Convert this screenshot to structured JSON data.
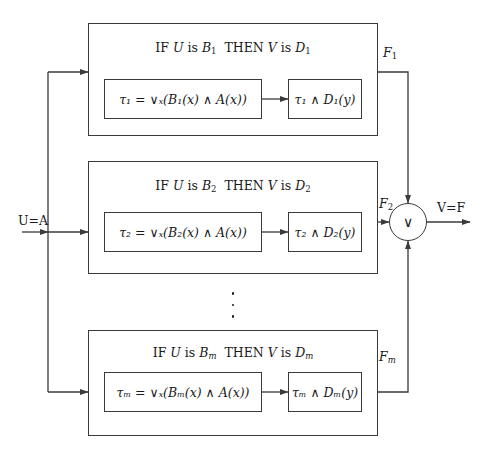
{
  "diagram": {
    "input_label": "U=A",
    "output_label": "V=F",
    "aggregator_symbol": "∨",
    "vertical_ellipsis": "⋮",
    "arrow_symbol": "→",
    "colors": {
      "line": "#3a3a3a",
      "text": "#1a1a1a",
      "background": "#ffffff"
    },
    "rules": [
      {
        "id": "rule-1",
        "header_prefix": "IF",
        "header_antecedent_var": "U",
        "header_is_1": "is",
        "header_antecedent_set": "B",
        "header_antecedent_sub": "1",
        "header_then": "THEN",
        "header_consequent_var": "V",
        "header_is_2": "is",
        "header_consequent_set": "D",
        "header_consequent_sub": "1",
        "tau_symbol": "τ",
        "tau_sub": "1",
        "firing_expr": "τ₁ = ∨ₓ(B₁(x) ∧ A(x))",
        "output_expr": "τ₁ ∧ D₁(y)",
        "out_label": "F",
        "out_label_sub": "1"
      },
      {
        "id": "rule-2",
        "header_prefix": "IF",
        "header_antecedent_var": "U",
        "header_is_1": "is",
        "header_antecedent_set": "B",
        "header_antecedent_sub": "2",
        "header_then": "THEN",
        "header_consequent_var": "V",
        "header_is_2": "is",
        "header_consequent_set": "D",
        "header_consequent_sub": "2",
        "tau_symbol": "τ",
        "tau_sub": "2",
        "firing_expr": "τ₂ = ∨ₓ(B₂(x) ∧ A(x))",
        "output_expr": "τ₂ ∧ D₂(y)",
        "out_label": "F",
        "out_label_sub": "2"
      },
      {
        "id": "rule-m",
        "header_prefix": "IF",
        "header_antecedent_var": "U",
        "header_is_1": "is",
        "header_antecedent_set": "B",
        "header_antecedent_sub": "m",
        "header_then": "THEN",
        "header_consequent_var": "V",
        "header_is_2": "is",
        "header_consequent_set": "D",
        "header_consequent_sub": "m",
        "tau_symbol": "τ",
        "tau_sub": "m",
        "firing_expr": "τₘ = ∨ₓ(Bₘ(x) ∧ A(x))",
        "output_expr": "τₘ ∧ Dₘ(y)",
        "out_label": "F",
        "out_label_sub": "m"
      }
    ]
  }
}
